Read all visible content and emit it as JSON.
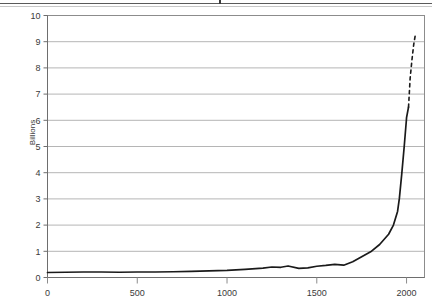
{
  "figure": {
    "axis_title_y": "Billions",
    "has_top_rule": true
  },
  "chart_data": {
    "type": "line",
    "title": "",
    "xlabel": "",
    "ylabel": "Billions",
    "xlim": [
      0,
      2100
    ],
    "ylim": [
      0,
      10
    ],
    "xticks": [
      0,
      500,
      1000,
      1500,
      2000
    ],
    "xtick_labels": [
      "0",
      "500",
      "1000",
      "1500",
      "2000"
    ],
    "yticks": [
      0,
      1,
      2,
      3,
      4,
      5,
      6,
      7,
      8,
      9,
      10
    ],
    "ytick_labels": [
      "0",
      "1",
      "2",
      "3",
      "4",
      "5",
      "6",
      "7",
      "8",
      "9",
      "10"
    ],
    "grid": "horizontal",
    "grid_color": "#b5b5b5",
    "line_color": "#1a1a1a",
    "legend": "none",
    "series": [
      {
        "name": "World population (historical)",
        "style": "solid",
        "x": [
          0,
          100,
          200,
          300,
          400,
          500,
          600,
          700,
          800,
          900,
          1000,
          1100,
          1200,
          1250,
          1300,
          1340,
          1400,
          1450,
          1500,
          1550,
          1600,
          1650,
          1700,
          1750,
          1800,
          1850,
          1900,
          1927,
          1950,
          1960,
          1974,
          1987,
          1999,
          2000,
          2011
        ],
        "y": [
          0.19,
          0.2,
          0.21,
          0.21,
          0.2,
          0.21,
          0.21,
          0.22,
          0.23,
          0.25,
          0.27,
          0.31,
          0.36,
          0.4,
          0.39,
          0.44,
          0.35,
          0.37,
          0.43,
          0.46,
          0.5,
          0.47,
          0.6,
          0.79,
          0.98,
          1.26,
          1.65,
          2.0,
          2.52,
          3.02,
          4.0,
          5.0,
          6.0,
          6.1,
          6.5
        ]
      },
      {
        "name": "World population (projection)",
        "style": "dashed",
        "x": [
          2011,
          2020,
          2030,
          2040,
          2050
        ],
        "y": [
          6.5,
          7.6,
          8.3,
          8.9,
          9.3
        ]
      }
    ],
    "annotations": []
  }
}
